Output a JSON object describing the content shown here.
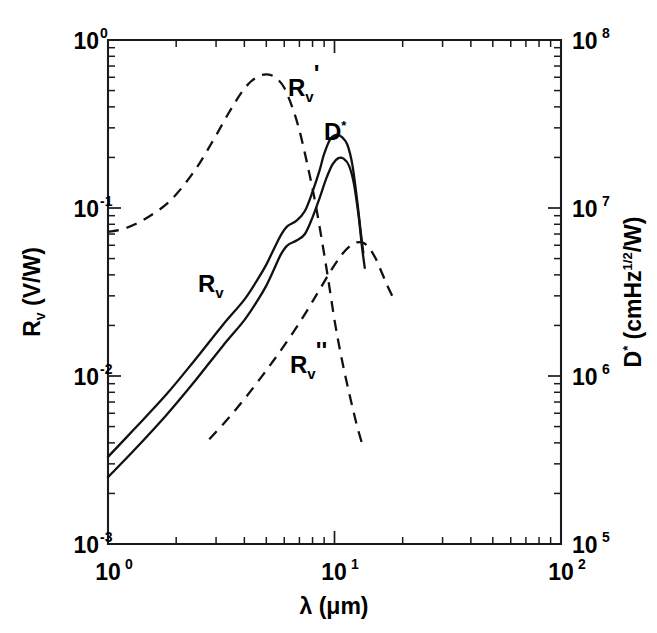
{
  "figure": {
    "background": "#ffffff",
    "ink_color": "#111111"
  },
  "chart_data": {
    "type": "line",
    "title": "",
    "subtitle": "",
    "xlabel": "λ (μm)",
    "xlabel_symbol": "λ",
    "xlabel_units": "(μm)",
    "xscale": "log",
    "xlim": [
      1,
      100
    ],
    "x_tick_labels": [
      "10⁰",
      "10¹",
      "10²"
    ],
    "x_tick_mantissa": "10",
    "x_tick_exponents": [
      "0",
      "1",
      "2"
    ],
    "x_tick_values": [
      1,
      10,
      100
    ],
    "ylabel": "Rᵥ (V/W)",
    "ylabel_symbol": "R",
    "ylabel_subscript": "v",
    "ylabel_units": "(V/W)",
    "yscale": "log",
    "ylim": [
      0.001,
      1
    ],
    "y_tick_labels": [
      "10⁻³",
      "10⁻²",
      "10⁻¹",
      "10⁰"
    ],
    "y_tick_mantissa": "10",
    "y_tick_exponents": [
      "-3",
      "-2",
      "-1",
      "0"
    ],
    "y_tick_values": [
      0.001,
      0.01,
      0.1,
      1
    ],
    "y2label": "D* (cmHz¹ᐟ²/W)",
    "y2label_symbol": "D",
    "y2label_star": "*",
    "y2label_units_pre": "(cmHz",
    "y2label_units_exp": "1/2",
    "y2label_units_post": "/W)",
    "y2scale": "log",
    "y2lim": [
      100000,
      100000000
    ],
    "y2_tick_labels": [
      "10⁵",
      "10⁶",
      "10⁷",
      "10⁸"
    ],
    "y2_tick_mantissa": "10",
    "y2_tick_exponents": [
      "5",
      "6",
      "7",
      "8"
    ],
    "y2_tick_values": [
      100000,
      1000000,
      10000000,
      100000000
    ],
    "grid": false,
    "legend": "inline-annotations",
    "minor_ticks": "log-decade-subdivisions",
    "tick_direction": "in",
    "series": [
      {
        "name": "R_v",
        "label": "Rᵥ",
        "style": "solid",
        "axis": "left",
        "x": [
          1.0,
          1.3,
          1.8,
          2.4,
          3.2,
          4.0,
          4.6,
          5.0,
          5.4,
          5.8,
          6.2,
          6.8,
          7.4,
          8.0,
          8.6,
          9.2,
          9.8,
          10.4,
          11.0,
          11.6,
          12.2,
          12.8,
          13.2,
          13.6
        ],
        "y": [
          0.0025,
          0.0036,
          0.0058,
          0.0092,
          0.015,
          0.0215,
          0.0285,
          0.0345,
          0.043,
          0.053,
          0.06,
          0.064,
          0.07,
          0.088,
          0.115,
          0.15,
          0.182,
          0.198,
          0.196,
          0.178,
          0.138,
          0.088,
          0.06,
          0.044
        ]
      },
      {
        "name": "D_star",
        "label": "D*",
        "style": "solid",
        "axis": "right",
        "x": [
          1.0,
          1.3,
          1.8,
          2.4,
          3.2,
          4.0,
          4.6,
          5.0,
          5.4,
          5.8,
          6.2,
          6.8,
          7.4,
          8.0,
          8.6,
          9.0,
          9.6,
          10.2,
          10.8,
          11.4,
          12.0,
          12.6,
          13.0,
          13.4
        ],
        "y": [
          0.0033,
          0.0048,
          0.0077,
          0.0123,
          0.02,
          0.0285,
          0.038,
          0.046,
          0.057,
          0.069,
          0.078,
          0.084,
          0.096,
          0.125,
          0.168,
          0.21,
          0.258,
          0.272,
          0.264,
          0.238,
          0.18,
          0.11,
          0.076,
          0.054
        ]
      },
      {
        "name": "R_v_prime",
        "label": "Rᵥ'",
        "style": "dashed",
        "axis": "left",
        "x": [
          1.0,
          1.2,
          1.5,
          1.9,
          2.4,
          2.9,
          3.4,
          3.9,
          4.3,
          4.7,
          5.0,
          5.3,
          5.6,
          6.0,
          6.5,
          7.0,
          7.6,
          8.2,
          8.8,
          9.4,
          10.0,
          10.6,
          11.2,
          11.8,
          12.5,
          13.2
        ],
        "y": [
          0.072,
          0.076,
          0.088,
          0.112,
          0.165,
          0.25,
          0.365,
          0.49,
          0.57,
          0.615,
          0.625,
          0.615,
          0.585,
          0.52,
          0.4,
          0.29,
          0.18,
          0.11,
          0.064,
          0.037,
          0.0215,
          0.014,
          0.0098,
          0.0072,
          0.0052,
          0.004
        ]
      },
      {
        "name": "R_v_double_prime",
        "label": "Rᵥ''",
        "style": "dashed",
        "axis": "left",
        "x": [
          2.8,
          3.4,
          4.1,
          5.0,
          6.0,
          7.2,
          8.4,
          9.6,
          10.8,
          11.8,
          12.6,
          13.4,
          14.2,
          15.2,
          16.2,
          17.2,
          18.2
        ],
        "y": [
          0.0042,
          0.0056,
          0.0076,
          0.0108,
          0.0152,
          0.022,
          0.031,
          0.042,
          0.053,
          0.06,
          0.0625,
          0.062,
          0.058,
          0.05,
          0.041,
          0.034,
          0.029
        ]
      }
    ],
    "annotations": [
      {
        "name": "R_v_prime_label",
        "text": "R",
        "sub": "v",
        "prime": "'",
        "x_px": 288,
        "y_px": 96
      },
      {
        "name": "D_star_label",
        "text": "D",
        "sub": "",
        "prime": "*",
        "x_px": 324,
        "y_px": 140
      },
      {
        "name": "R_v_label",
        "text": "R",
        "sub": "v",
        "prime": "",
        "x_px": 198,
        "y_px": 292
      },
      {
        "name": "R_v_double_prime_label",
        "text": "R",
        "sub": "v",
        "prime": "''",
        "x_px": 290,
        "y_px": 373
      }
    ]
  }
}
